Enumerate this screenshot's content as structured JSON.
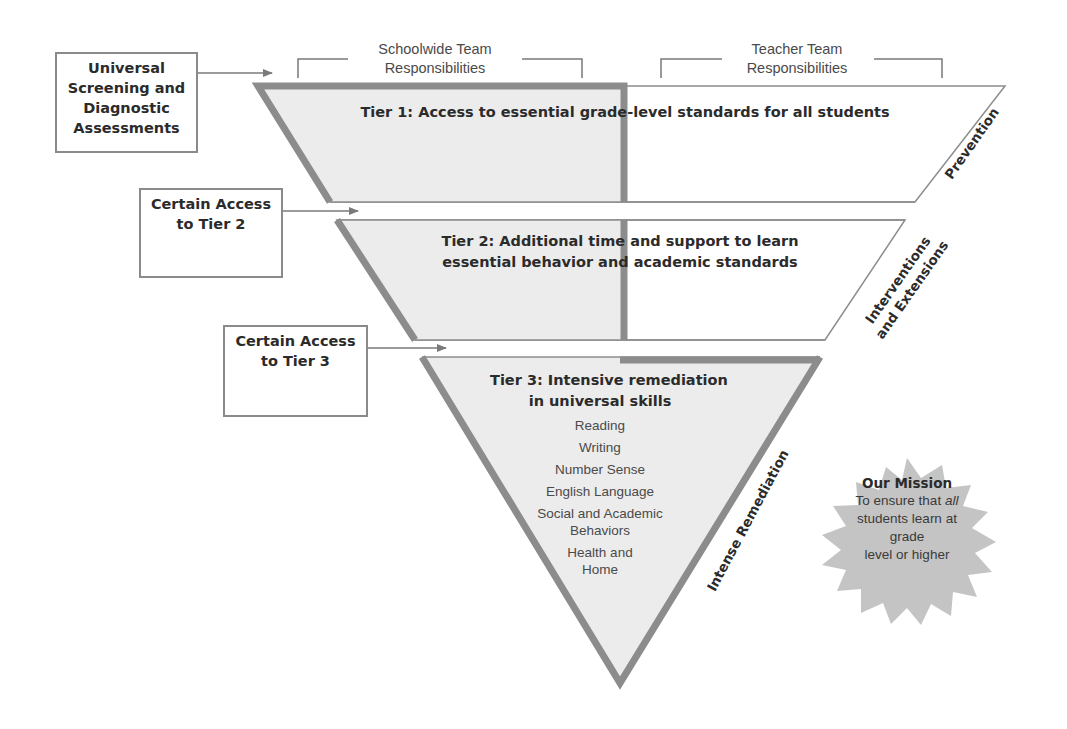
{
  "column_headers": {
    "schoolwide": {
      "line1": "Schoolwide Team",
      "line2": "Responsibilities"
    },
    "teacher": {
      "line1": "Teacher Team",
      "line2": "Responsibilities"
    }
  },
  "side_boxes": {
    "screening": {
      "lines": [
        "Universal",
        "Screening and",
        "Diagnostic",
        "Assessments"
      ]
    },
    "tier2_access": {
      "lines": [
        "Certain Access",
        "to Tier 2"
      ]
    },
    "tier3_access": {
      "lines": [
        "Certain Access",
        "to Tier 3"
      ]
    }
  },
  "tiers": {
    "tier1": {
      "title": "Tier 1: Access to essential grade-level standards for all students",
      "side_label": "Prevention"
    },
    "tier2": {
      "title_line1": "Tier 2: Additional time and support to learn",
      "title_line2": "essential behavior and academic standards",
      "side_label_line1": "Interventions",
      "side_label_line2": "and Extensions"
    },
    "tier3": {
      "title_line1": "Tier 3: Intensive remediation",
      "title_line2": "in universal skills",
      "side_label": "Intense Remediation",
      "skills": [
        {
          "line1": "Reading"
        },
        {
          "line1": "Writing"
        },
        {
          "line1": "Number Sense"
        },
        {
          "line1": "English Language"
        },
        {
          "line1": "Social and Academic",
          "line2": "Behaviors"
        },
        {
          "line1": "Health and",
          "line2": "Home"
        }
      ]
    }
  },
  "mission": {
    "title": "Our Mission",
    "line1_pre": "To ensure that ",
    "line1_emph": "all",
    "line2": "students learn at",
    "line3": "grade",
    "line4": "level or higher"
  },
  "colors": {
    "border_gray": "#8c8c8c",
    "fill_gray": "#ececec",
    "starburst": "#c4c4c4",
    "text_dark": "#2b2b2b"
  }
}
